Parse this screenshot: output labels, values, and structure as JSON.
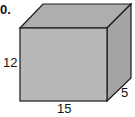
{
  "problem": {
    "number_label": "0."
  },
  "prism": {
    "fill_front": "#b8b8b8",
    "fill_top": "#aeaeae",
    "fill_side": "#a4a4a4",
    "edge_color": "#1a1a1a",
    "dimensions": {
      "height": "12",
      "length": "15",
      "depth": "5"
    }
  }
}
